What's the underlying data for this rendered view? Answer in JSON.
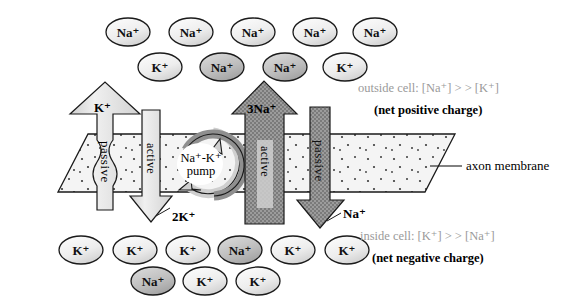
{
  "figure": {
    "membrane_label": "axon membrane"
  },
  "annotations": {
    "outside_conc": "outside cell: [Na⁺] > > [K⁺]",
    "outside_charge": "(net positive charge)",
    "inside_conc": "inside cell: [K⁺] > > [Na⁺]",
    "inside_charge": "(net negative charge)",
    "axon_membrane": "axon membrane"
  },
  "arrows": {
    "k_passive": {
      "head_label": "K⁺",
      "body_label": "passive",
      "direction": "up",
      "type": "passive",
      "shade": "light"
    },
    "k_active": {
      "body_label": "active",
      "tip_label": "2K⁺",
      "direction": "down",
      "type": "active",
      "shade": "light"
    },
    "na_active": {
      "head_label": "3Na⁺",
      "body_label": "active",
      "direction": "up",
      "type": "active",
      "shade": "dark"
    },
    "na_passive": {
      "body_label": "passive",
      "tip_label": "Na⁺",
      "direction": "down",
      "type": "passive",
      "shade": "dark"
    }
  },
  "pump": {
    "label_line1": "Na⁺-K⁺",
    "label_line2": "pump"
  },
  "ions": {
    "outside_row1": [
      {
        "label": "Na⁺",
        "cx": 128,
        "cy": 32,
        "shade": "light"
      },
      {
        "label": "Na⁺",
        "cx": 191,
        "cy": 32,
        "shade": "light"
      },
      {
        "label": "Na⁺",
        "cx": 253,
        "cy": 32,
        "shade": "light"
      },
      {
        "label": "Na⁺",
        "cx": 315,
        "cy": 32,
        "shade": "light"
      },
      {
        "label": "Na⁺",
        "cx": 375,
        "cy": 32,
        "shade": "light"
      }
    ],
    "outside_row2": [
      {
        "label": "K⁺",
        "cx": 160,
        "cy": 67,
        "shade": "light"
      },
      {
        "label": "Na⁺",
        "cx": 222,
        "cy": 67,
        "shade": "dark"
      },
      {
        "label": "Na⁺",
        "cx": 285,
        "cy": 67,
        "shade": "dark"
      },
      {
        "label": "K⁺",
        "cx": 345,
        "cy": 67,
        "shade": "light"
      }
    ],
    "inside_row1": [
      {
        "label": "K⁺",
        "cx": 81,
        "cy": 250,
        "shade": "light"
      },
      {
        "label": "K⁺",
        "cx": 135,
        "cy": 250,
        "shade": "light"
      },
      {
        "label": "K⁺",
        "cx": 188,
        "cy": 250,
        "shade": "light"
      },
      {
        "label": "Na⁺",
        "cx": 240,
        "cy": 250,
        "shade": "dark"
      },
      {
        "label": "K⁺",
        "cx": 293,
        "cy": 250,
        "shade": "light"
      },
      {
        "label": "K⁺",
        "cx": 347,
        "cy": 250,
        "shade": "light"
      }
    ],
    "inside_row2": [
      {
        "label": "Na⁺",
        "cx": 153,
        "cy": 281,
        "shade": "dark"
      },
      {
        "label": "K⁺",
        "cx": 205,
        "cy": 281,
        "shade": "light"
      },
      {
        "label": "K⁺",
        "cx": 258,
        "cy": 281,
        "shade": "light"
      }
    ]
  },
  "colors": {
    "ion_light": "#e9e9e9",
    "ion_dark": "#b8b8b8",
    "arrow_light": "#dcdcdc",
    "arrow_dark": "#8a8a8a",
    "membrane_fill": "#f2f2f2",
    "stroke": "#1a1a1a",
    "gray_text": "#9a9a9a",
    "black_text": "#000000"
  }
}
